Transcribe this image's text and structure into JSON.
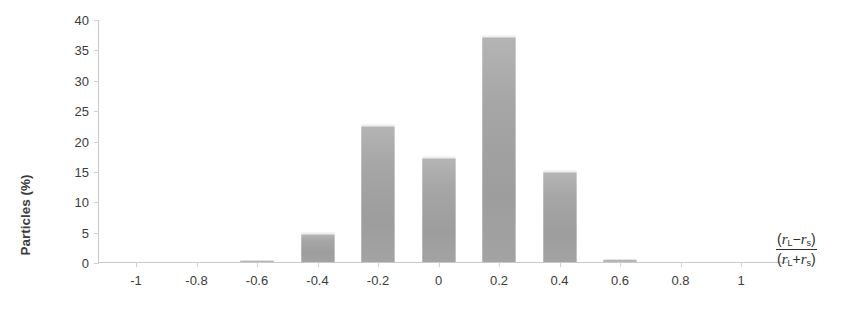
{
  "chart_data": {
    "type": "bar",
    "title": "",
    "subtitle": "",
    "xlabel": "(r_L - r_s) / (r_L + r_s)",
    "xlabel_numerator": "(r L - r s)",
    "xlabel_denominator": "(r L + r s)",
    "ylabel": "Particles (%)",
    "categories": [
      "-1",
      "-0.8",
      "-0.6",
      "-0.4",
      "-0.2",
      "0",
      "0.2",
      "0.4",
      "0.6",
      "0.8",
      "1"
    ],
    "values": [
      0,
      0,
      0.3,
      5.0,
      22.7,
      17.5,
      37.4,
      15.2,
      0.5,
      0,
      0
    ],
    "xlim": [
      -1.1,
      1.1
    ],
    "ylim": [
      0,
      40
    ],
    "ytick_labels": [
      "0",
      "5",
      "10",
      "15",
      "20",
      "25",
      "30",
      "35",
      "40"
    ],
    "ytick_values": [
      0,
      5,
      10,
      15,
      20,
      25,
      30,
      35,
      40
    ],
    "grid": false,
    "legend": "none",
    "bar_color": "#a3a3a3",
    "axis_color": "#c9c9c9",
    "text_color": "#3c3c3c"
  }
}
